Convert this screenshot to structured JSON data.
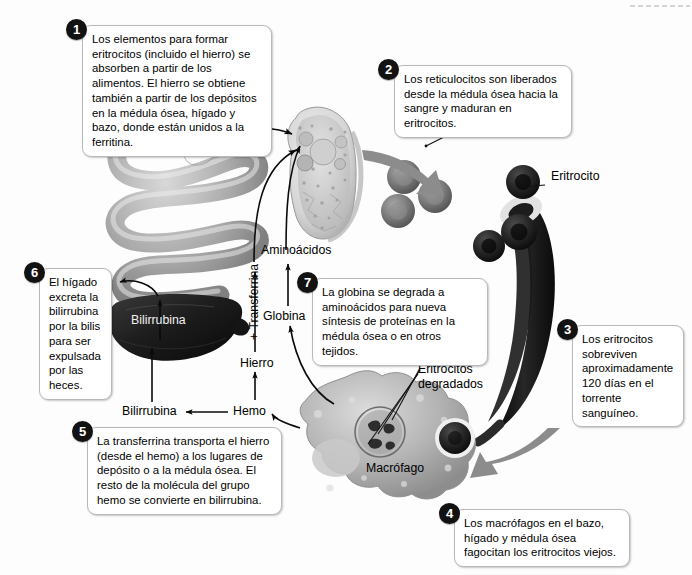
{
  "diagram": {
    "language": "es",
    "background_color": "#fdfdfd",
    "badge_color": "#121212",
    "box_border_color": "#b9b9b9"
  },
  "steps": [
    {
      "number": "1",
      "text": "Los elementos para formar eritrocitos (incluido el hierro) se absorben a partir de los alimentos. El hierro se obtiene también a partir de los depósitos en la médula ósea, hígado y bazo, donde están unidos a la ferritina."
    },
    {
      "number": "2",
      "text": "Los reticulocitos son liberados desde la médula ósea hacia la sangre y maduran en eritrocitos."
    },
    {
      "number": "3",
      "text": "Los eritrocitos sobreviven aproximadamente 120 días en el torrente sanguíneo."
    },
    {
      "number": "4",
      "text": "Los macrófagos en el bazo, hígado y médula ósea fagocitan los eritrocitos viejos."
    },
    {
      "number": "5",
      "text": "La transferrina transporta el hierro (desde el hemo) a los lugares de depósito o a la médula ósea. El resto de la molécula del grupo hemo se convierte en bilirrubina."
    },
    {
      "number": "6",
      "text": "El hígado excreta la bilirrubina por la bilis para ser expulsada por las heces."
    },
    {
      "number": "7",
      "text": "La globina se degrada a aminoácidos para nueva síntesis de proteínas en la médula ósea o en otros tejidos."
    }
  ],
  "labels": {
    "reticulocito": "Reticulocito",
    "eritrocito": "Eritrocito",
    "eritrocitos_degradados": "Eritrocitos degradados",
    "macrofago": "Macrófago",
    "bilirrubina_higado": "Bilirrubina",
    "bilirrubina_flujo": "Bilirrubina",
    "hemo": "Hemo",
    "hierro": "Hierro",
    "transferrina": "+ Transferrina",
    "globina": "Globina",
    "aminoacidos": "Aminoácidos"
  }
}
